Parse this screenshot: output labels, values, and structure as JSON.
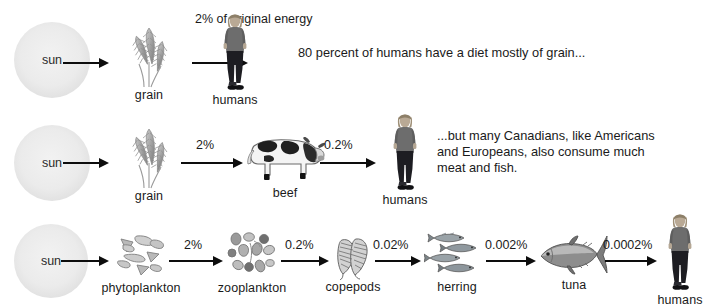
{
  "figure": {
    "background": "#ffffff",
    "ink": "#1a1a1a"
  },
  "rows": [
    {
      "id": "row-grain-humans",
      "nodes": [
        {
          "key": "sun",
          "label": "sun",
          "icon": "sun-icon"
        },
        {
          "key": "grain",
          "label": "grain",
          "icon": "grain-icon"
        },
        {
          "key": "humans",
          "label": "humans",
          "icon": "human-figure-icon"
        }
      ],
      "arrows": [
        {
          "key": "sun-to-grain",
          "percent": ""
        },
        {
          "key": "grain-to-humans",
          "percent": "2% of\noriginal\nenergy"
        }
      ],
      "caption": "80 percent of humans have a diet mostly of grain..."
    },
    {
      "id": "row-beef-humans",
      "nodes": [
        {
          "key": "sun",
          "label": "sun",
          "icon": "sun-icon"
        },
        {
          "key": "grain",
          "label": "grain",
          "icon": "grain-icon"
        },
        {
          "key": "beef",
          "label": "beef",
          "icon": "cow-icon"
        },
        {
          "key": "humans",
          "label": "humans",
          "icon": "human-figure-icon"
        }
      ],
      "arrows": [
        {
          "key": "sun-to-grain",
          "percent": ""
        },
        {
          "key": "grain-to-beef",
          "percent": "2%"
        },
        {
          "key": "beef-to-humans",
          "percent": "0.2%"
        }
      ],
      "caption": "...but many Canadians, like Americans\nand Europeans, also consume much\nmeat and fish."
    },
    {
      "id": "row-marine-humans",
      "nodes": [
        {
          "key": "sun",
          "label": "sun",
          "icon": "sun-icon"
        },
        {
          "key": "phytoplankton",
          "label": "phytoplankton",
          "icon": "phytoplankton-icon"
        },
        {
          "key": "zooplankton",
          "label": "zooplankton",
          "icon": "zooplankton-icon"
        },
        {
          "key": "copepods",
          "label": "copepods",
          "icon": "copepod-icon"
        },
        {
          "key": "herring",
          "label": "herring",
          "icon": "herring-school-icon"
        },
        {
          "key": "tuna",
          "label": "tuna",
          "icon": "tuna-icon"
        },
        {
          "key": "humans",
          "label": "humans",
          "icon": "human-figure-icon"
        }
      ],
      "arrows": [
        {
          "key": "sun-to-phytoplankton",
          "percent": ""
        },
        {
          "key": "phytoplankton-to-zooplankton",
          "percent": "2%"
        },
        {
          "key": "zooplankton-to-copepods",
          "percent": "0.2%"
        },
        {
          "key": "copepods-to-herring",
          "percent": "0.02%"
        },
        {
          "key": "herring-to-tuna",
          "percent": "0.002%"
        },
        {
          "key": "tuna-to-humans",
          "percent": "0.0002%"
        }
      ],
      "caption": ""
    }
  ]
}
